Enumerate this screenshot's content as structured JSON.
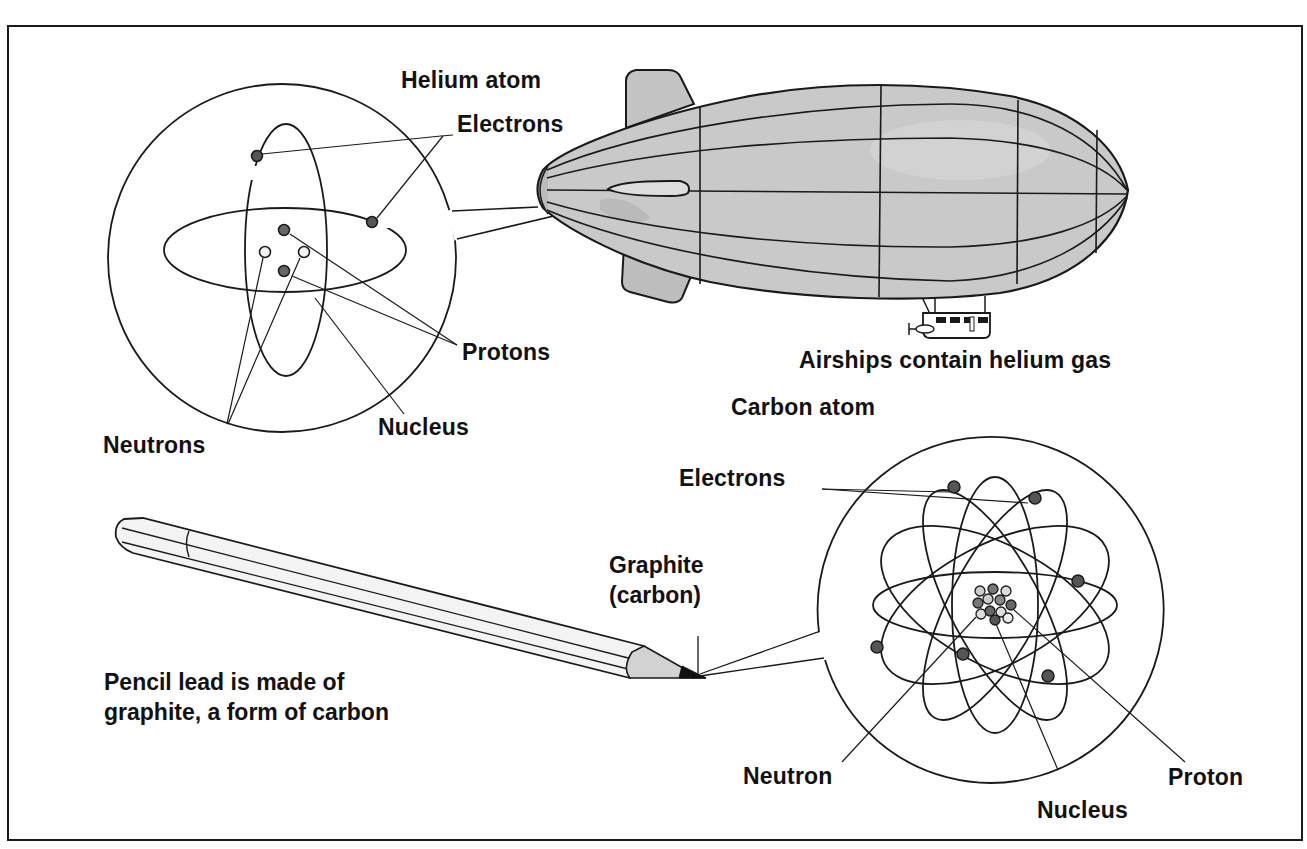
{
  "figure": {
    "helium_atom": {
      "title": "Helium atom",
      "labels": {
        "electrons": "Electrons",
        "protons": "Protons",
        "neutrons": "Neutrons",
        "nucleus": "Nucleus"
      },
      "particles": {
        "electrons": 2,
        "protons": 2,
        "neutrons": 2
      }
    },
    "airship": {
      "caption": "Airships contain helium gas"
    },
    "carbon_atom": {
      "title": "Carbon atom",
      "labels": {
        "electrons": "Electrons",
        "neutron": "Neutron",
        "nucleus": "Nucleus",
        "proton": "Proton"
      },
      "particles": {
        "electrons": 6,
        "nucleons": 12
      }
    },
    "pencil": {
      "tip_label_line1": "Graphite",
      "tip_label_line2": "(carbon)",
      "caption_line1": "Pencil lead is made of",
      "caption_line2": "graphite, a form of carbon"
    }
  },
  "colors": {
    "line": "#1a1a1a",
    "airship_fill": "#c9c9c9",
    "airship_shade": "#b5b5b5",
    "electron": "#555555",
    "proton": "#6a6a6a",
    "neutron": "#e8e8e8",
    "pencil_body": "#f2f2f2",
    "pencil_wood": "#d0d0d0"
  }
}
